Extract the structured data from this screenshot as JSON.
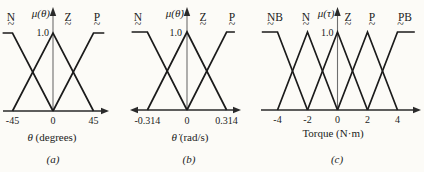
{
  "figure": {
    "background": "#fcfbf7",
    "ink": "#1b1b1b",
    "axis_ink": "#2a2a2a",
    "yaxis_shaft": "#6e6e6e"
  },
  "chart_data": [
    {
      "id": "a",
      "type": "line",
      "subtype": "fuzzy-membership-functions",
      "caption": "(a)",
      "y_axis_label": "μ(θ)",
      "y_peak_label": "1.0",
      "x_var_label": "θ",
      "x_unit_label": " (degrees)",
      "ylim": [
        0,
        1
      ],
      "x_ticks": [
        {
          "v": -45,
          "label": "-45"
        },
        {
          "v": 0,
          "label": "0"
        },
        {
          "v": 45,
          "label": "45"
        }
      ],
      "series": [
        {
          "name": "N",
          "shape": "left-shoulder",
          "points": [
            [
              -56,
              1
            ],
            [
              -45,
              1
            ],
            [
              0,
              0
            ]
          ]
        },
        {
          "name": "Z",
          "shape": "triangle",
          "points": [
            [
              -45,
              0
            ],
            [
              0,
              1
            ],
            [
              45,
              0
            ]
          ]
        },
        {
          "name": "P",
          "shape": "right-shoulder",
          "points": [
            [
              0,
              0
            ],
            [
              45,
              1
            ],
            [
              57,
              1
            ]
          ]
        }
      ],
      "set_labels": [
        {
          "text": "N",
          "x_px": 11,
          "tilde_dx": 0
        },
        {
          "text": "Z",
          "x_px": 68,
          "tilde_dx": 0
        },
        {
          "text": "P",
          "x_px": 97,
          "tilde_dx": 0
        }
      ],
      "arrows": {
        "x_left": false,
        "x_right": true,
        "y_top": true
      },
      "layout": {
        "width_px": 128,
        "origin_px": 53,
        "px_per_unit": 0.9,
        "baseline_y": 111,
        "peak_y": 33,
        "axis_left_px": 3,
        "axis_right_px": 109,
        "mu_gap": 3,
        "one_gap": 4,
        "x_label_cx": 52,
        "x_label_y": 141,
        "caption_cx": 53,
        "caption_y": 163,
        "tick_y": 124
      }
    },
    {
      "id": "b",
      "type": "line",
      "subtype": "fuzzy-membership-functions",
      "caption": "(b)",
      "y_axis_label": "μ(θ̇)",
      "y_peak_label": "1.0",
      "x_var_label": "θ̇",
      "x_unit_label": " (rad/s)",
      "ylim": [
        0,
        1
      ],
      "x_ticks": [
        {
          "v": -0.314,
          "label": "-0.314"
        },
        {
          "v": 0,
          "label": "0"
        },
        {
          "v": 0.314,
          "label": "0.314"
        }
      ],
      "series": [
        {
          "name": "N",
          "shape": "left-shoulder",
          "points": [
            [
              -0.44,
              1
            ],
            [
              -0.314,
              1
            ],
            [
              0,
              0
            ]
          ]
        },
        {
          "name": "Z",
          "shape": "triangle",
          "points": [
            [
              -0.314,
              0
            ],
            [
              0,
              1
            ],
            [
              0.314,
              0
            ]
          ]
        },
        {
          "name": "P",
          "shape": "right-shoulder",
          "points": [
            [
              0,
              0
            ],
            [
              0.314,
              1
            ],
            [
              0.38,
              1
            ]
          ]
        }
      ],
      "set_labels": [
        {
          "text": "N",
          "x_px": 10,
          "tilde_dx": 0
        },
        {
          "text": "Z",
          "x_px": 75,
          "tilde_dx": 0
        },
        {
          "text": "P",
          "x_px": 104,
          "tilde_dx": 0
        }
      ],
      "arrows": {
        "x_left": true,
        "x_right": true,
        "y_top": true
      },
      "layout": {
        "width_px": 132,
        "origin_px": 59,
        "px_per_unit": 126,
        "baseline_y": 110,
        "peak_y": 32,
        "axis_left_px": 2,
        "axis_right_px": 113,
        "mu_gap": 3,
        "one_gap": 5,
        "x_label_cx": 62,
        "x_label_y": 141,
        "caption_cx": 61,
        "caption_y": 163,
        "tick_y": 124
      }
    },
    {
      "id": "c",
      "type": "line",
      "subtype": "fuzzy-membership-functions",
      "caption": "(c)",
      "y_axis_label": "μ(τ)",
      "y_peak_label": "1.0",
      "x_var_label": "",
      "x_unit_label": "Torque (N·m)",
      "ylim": [
        0,
        1
      ],
      "x_ticks": [
        {
          "v": -4,
          "label": "-4"
        },
        {
          "v": -2,
          "label": "-2"
        },
        {
          "v": 0,
          "label": "0"
        },
        {
          "v": 2,
          "label": "2"
        },
        {
          "v": 4,
          "label": "4"
        }
      ],
      "series": [
        {
          "name": "NB",
          "shape": "left-shoulder",
          "points": [
            [
              -5.05,
              1
            ],
            [
              -4,
              1
            ],
            [
              -2,
              0
            ]
          ]
        },
        {
          "name": "N",
          "shape": "triangle",
          "points": [
            [
              -4,
              0
            ],
            [
              -2,
              1
            ],
            [
              0,
              0
            ]
          ]
        },
        {
          "name": "Z",
          "shape": "triangle",
          "points": [
            [
              -2,
              0
            ],
            [
              0,
              1
            ],
            [
              2,
              0
            ]
          ]
        },
        {
          "name": "P",
          "shape": "triangle",
          "points": [
            [
              0,
              0
            ],
            [
              2,
              1
            ],
            [
              4,
              0
            ]
          ]
        },
        {
          "name": "PB",
          "shape": "right-shoulder",
          "points": [
            [
              2,
              0
            ],
            [
              4,
              1
            ],
            [
              5.15,
              1
            ]
          ]
        }
      ],
      "set_labels": [
        {
          "text": "NB",
          "x_px": 15,
          "tilde_dx": -4.5
        },
        {
          "text": "N",
          "x_px": 46,
          "tilde_dx": 0
        },
        {
          "text": "Z",
          "x_px": 88,
          "tilde_dx": 0
        },
        {
          "text": "P",
          "x_px": 112,
          "tilde_dx": 0
        },
        {
          "text": "PB",
          "x_px": 145,
          "tilde_dx": -4.5
        }
      ],
      "arrows": {
        "x_left": false,
        "x_right": true,
        "y_top": true
      },
      "layout": {
        "width_px": 164,
        "origin_px": 77.5,
        "px_per_unit": 15,
        "baseline_y": 110,
        "peak_y": 32,
        "axis_left_px": 1,
        "axis_right_px": 161,
        "mu_gap": 3,
        "one_gap": 4,
        "x_label_cx": 73,
        "x_label_y": 137,
        "caption_cx": 77,
        "caption_y": 163,
        "tick_y": 123
      }
    }
  ]
}
